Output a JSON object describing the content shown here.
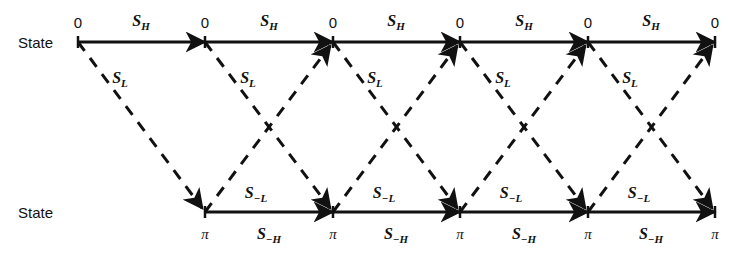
{
  "diagram": {
    "rows": [
      {
        "name": "top",
        "label": "State",
        "node_value": "0",
        "y": 42
      },
      {
        "name": "bottom",
        "label": "State",
        "node_value": "π",
        "y": 212
      }
    ],
    "labels": {
      "state": "State",
      "state_zero": "0",
      "state_pi": "π"
    },
    "top_nodes_x": [
      78,
      205,
      333,
      460,
      588,
      715
    ],
    "bottom_nodes_x": [
      205,
      333,
      460,
      588,
      715
    ],
    "edges": {
      "top_horizontal": {
        "symbol": "S",
        "subscript": "H",
        "style": "solid",
        "label": "S_H",
        "count": 5
      },
      "bottom_horizontal": {
        "symbol": "S",
        "subscript": "−H",
        "style": "solid",
        "label": "S_-H",
        "count": 4
      },
      "down_diagonal": {
        "symbol": "S",
        "subscript": "L",
        "style": "dashed",
        "label": "S_L",
        "count": 5
      },
      "up_diagonal": {
        "symbol": "S",
        "subscript": "−L",
        "style": "dashed",
        "label": "S_-L",
        "count": 4
      }
    },
    "top_edge_labels": [
      {
        "symbol": "S",
        "sub": "H",
        "x": 141,
        "y": 22
      },
      {
        "symbol": "S",
        "sub": "H",
        "x": 269,
        "y": 22
      },
      {
        "symbol": "S",
        "sub": "H",
        "x": 396,
        "y": 22
      },
      {
        "symbol": "S",
        "sub": "H",
        "x": 524,
        "y": 22
      },
      {
        "symbol": "S",
        "sub": "H",
        "x": 651,
        "y": 22
      }
    ],
    "bottom_edge_labels": [
      {
        "symbol": "S",
        "sub": "−H",
        "x": 269,
        "y": 235
      },
      {
        "symbol": "S",
        "sub": "−H",
        "x": 396,
        "y": 235
      },
      {
        "symbol": "S",
        "sub": "−H",
        "x": 524,
        "y": 235
      },
      {
        "symbol": "S",
        "sub": "−H",
        "x": 651,
        "y": 235
      }
    ],
    "down_diagonal_labels": [
      {
        "symbol": "S",
        "sub": "L",
        "x": 120,
        "y": 79
      },
      {
        "symbol": "S",
        "sub": "L",
        "x": 248,
        "y": 79
      },
      {
        "symbol": "S",
        "sub": "L",
        "x": 375,
        "y": 79
      },
      {
        "symbol": "S",
        "sub": "L",
        "x": 503,
        "y": 79
      },
      {
        "symbol": "S",
        "sub": "L",
        "x": 630,
        "y": 79
      }
    ],
    "up_diagonal_labels": [
      {
        "symbol": "S",
        "sub": "−L",
        "x": 256,
        "y": 194
      },
      {
        "symbol": "S",
        "sub": "−L",
        "x": 384,
        "y": 194
      },
      {
        "symbol": "S",
        "sub": "−L",
        "x": 511,
        "y": 194
      },
      {
        "symbol": "S",
        "sub": "−L",
        "x": 639,
        "y": 194
      }
    ],
    "row_label_positions": [
      {
        "x": 18,
        "y": 42
      },
      {
        "x": 18,
        "y": 212
      }
    ],
    "top_node_label_y": 22,
    "bottom_node_label_y": 234,
    "colors": {
      "ink": "#111111",
      "background": "#ffffff"
    },
    "geometry": {
      "top_y": 42,
      "bottom_y": 212,
      "spacing": 127.4,
      "stroke_width": 3,
      "dash_pattern": "11 9"
    }
  }
}
